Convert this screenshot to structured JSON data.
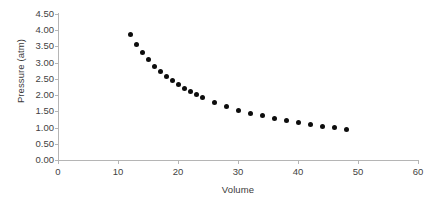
{
  "chart_data": {
    "type": "scatter",
    "title": "",
    "xlabel": "Volume",
    "ylabel": "Pressure (atm)",
    "xlim": [
      0,
      60
    ],
    "ylim": [
      0,
      4.5
    ],
    "xticks": [
      "0",
      "10",
      "20",
      "30",
      "40",
      "50",
      "60"
    ],
    "xtick_values": [
      0,
      10,
      20,
      30,
      40,
      50,
      60
    ],
    "yticks": [
      "0.00",
      "0.50",
      "1.00",
      "1.50",
      "2.00",
      "2.50",
      "3.00",
      "3.50",
      "4.00",
      "4.50"
    ],
    "ytick_values": [
      0,
      0.5,
      1.0,
      1.5,
      2.0,
      2.5,
      3.0,
      3.5,
      4.0,
      4.5
    ],
    "grid": false,
    "legend": false,
    "marker_color": "#0d0d0d",
    "axis_color": "#b5b5b5",
    "series": [
      {
        "name": "Pressure vs Volume",
        "x": [
          12,
          13,
          14,
          15,
          16,
          17,
          18,
          19,
          20,
          21,
          22,
          23,
          24,
          26,
          28,
          30,
          32,
          34,
          36,
          38,
          40,
          42,
          44,
          46,
          48
        ],
        "y": [
          3.88,
          3.56,
          3.31,
          3.09,
          2.88,
          2.72,
          2.57,
          2.44,
          2.32,
          2.21,
          2.11,
          2.02,
          1.92,
          1.78,
          1.65,
          1.53,
          1.44,
          1.36,
          1.27,
          1.21,
          1.15,
          1.09,
          1.04,
          0.99,
          0.94
        ]
      }
    ]
  },
  "chart": {
    "x_axis_title": "Volume",
    "y_axis_title": "Pressure (atm)"
  }
}
